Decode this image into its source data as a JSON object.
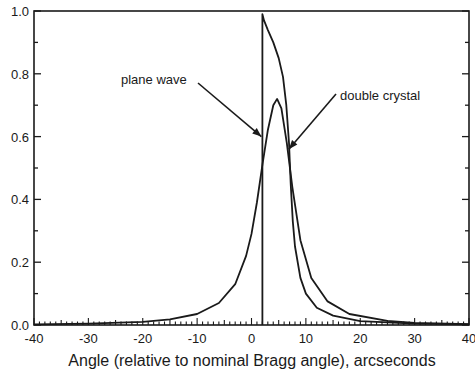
{
  "chart_data": {
    "type": "line",
    "title": "",
    "xlabel": "Angle (relative to nominal Bragg angle), arcseconds",
    "ylabel": "",
    "xlim": [
      -40,
      40
    ],
    "ylim": [
      0.0,
      1.0
    ],
    "x_ticks": [
      "-40",
      "-30",
      "-20",
      "-10",
      "0",
      "10",
      "20",
      "30",
      "40"
    ],
    "y_ticks": [
      "0.0",
      "0.2",
      "0.4",
      "0.6",
      "0.8",
      "1.0"
    ],
    "grid": false,
    "legend": "none",
    "series": [
      {
        "name": "plane wave",
        "x": [
          2.0,
          2.0,
          2.3,
          3.0,
          4.0,
          5.0,
          5.8,
          6.4,
          6.9,
          7.2,
          7.6,
          8.0,
          9.0,
          10.0,
          12.0,
          15.0,
          20.0,
          30.0,
          40.0
        ],
        "values": [
          0.0,
          0.99,
          0.97,
          0.94,
          0.9,
          0.85,
          0.79,
          0.7,
          0.58,
          0.45,
          0.33,
          0.25,
          0.15,
          0.1,
          0.055,
          0.03,
          0.012,
          0.004,
          0.002
        ]
      },
      {
        "name": "double crystal",
        "x": [
          -40,
          -30,
          -20,
          -15,
          -10,
          -6,
          -3,
          -1,
          0,
          1,
          2,
          3,
          4,
          4.7,
          5.5,
          6.5,
          7.5,
          9,
          11,
          14,
          18,
          25,
          30,
          40
        ],
        "values": [
          0.002,
          0.004,
          0.01,
          0.018,
          0.035,
          0.07,
          0.13,
          0.22,
          0.29,
          0.39,
          0.51,
          0.62,
          0.7,
          0.72,
          0.69,
          0.58,
          0.44,
          0.27,
          0.15,
          0.075,
          0.035,
          0.013,
          0.007,
          0.003
        ]
      }
    ],
    "annotations": [
      {
        "text": "plane wave",
        "arrow_to": [
          2.0,
          0.6
        ]
      },
      {
        "text": "double crystal",
        "arrow_to": [
          6.5,
          0.56
        ]
      }
    ]
  }
}
